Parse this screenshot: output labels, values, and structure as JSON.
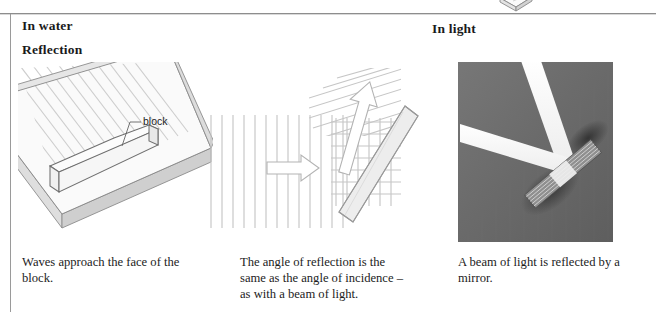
{
  "page": {
    "left_rule_color": "#9a9a9a",
    "top_rule_color": "#8d8d8d",
    "background": "#ffffff"
  },
  "headings": {
    "in_water": "In water",
    "reflection": "Reflection",
    "in_light": "In light"
  },
  "figures": {
    "tank": {
      "name": "ripple-tank-with-block-diagram",
      "annotation_label": "block",
      "description": "Isometric line drawing of a shallow ripple tank with straight waves and a rectangular block lying on its surface",
      "line_color": "#6f6f6f",
      "fill_color": "#f4f4f4",
      "wave_color": "#cfcfcf"
    },
    "waves": {
      "name": "wave-reflection-diagram",
      "description": "Parallel incident wavefronts travel right, strike an angled barrier and reflect upward; arrows show incident and reflected directions",
      "incident_arrow": "right-arrow",
      "reflected_arrow": "up-arrow",
      "wave_color": "#c3c3c3",
      "barrier_fill": "#eeeeee",
      "barrier_stroke": "#9a9a9a"
    },
    "photo": {
      "name": "light-beam-mirror-photograph",
      "description": "Black and white photograph of a narrow beam of light striking a mirror and reflecting away at an equal angle",
      "background": "#6b6b6b",
      "beam_color": "#f2f2f2"
    }
  },
  "captions": {
    "water_waves": {
      "line1": "Waves approach the face of the",
      "line2": "block."
    },
    "angle_of_reflection": {
      "line1": "The angle of reflection is the",
      "line2": "same as the angle of incidence –",
      "line3": "as with a beam of light."
    },
    "light_mirror": {
      "line1": "A beam of light is reflected by a",
      "line2": "mirror."
    }
  }
}
